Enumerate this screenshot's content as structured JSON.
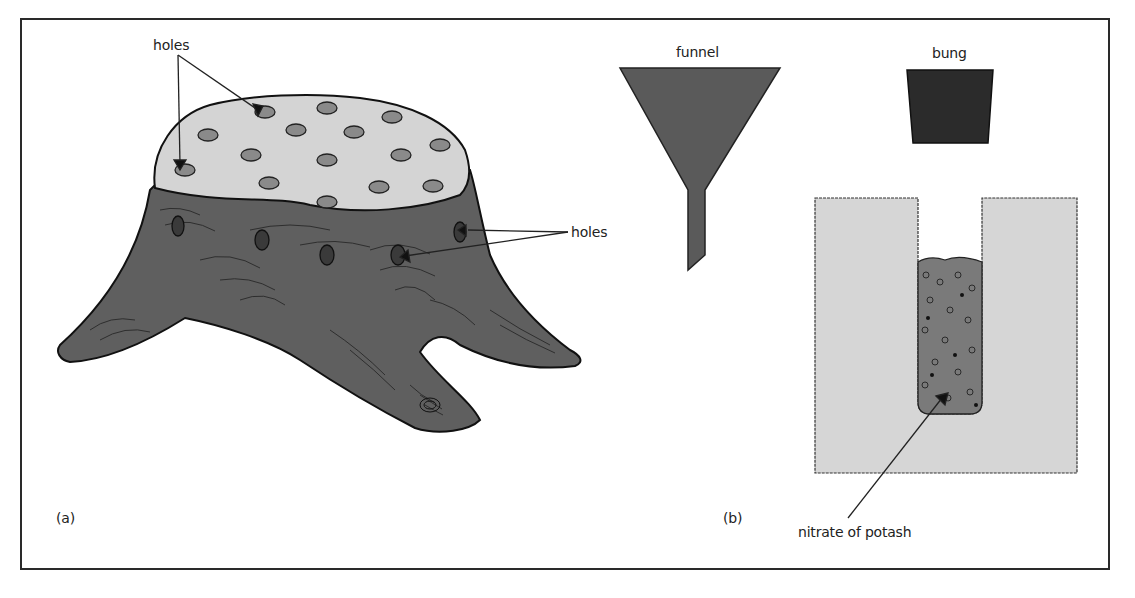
{
  "diagram": {
    "panels": [
      {
        "id": "a",
        "label": "(a)",
        "subject": "tree stump"
      },
      {
        "id": "b",
        "label": "(b)",
        "subject": "stump cross-section with funnel and bung"
      }
    ],
    "labels": {
      "holes_top": "holes",
      "holes_side": "holes",
      "funnel": "funnel",
      "bung": "bung",
      "nitrate": "nitrate of potash",
      "panel_a": "(a)",
      "panel_b": "(b)"
    },
    "colors": {
      "stump_bark": "#5f5f5f",
      "stump_top": "#d4d4d4",
      "funnel": "#5a5a5a",
      "bung": "#2b2b2b",
      "section": "#d6d6d6",
      "fill": "#7a7a7a",
      "frame": "#2a2a2a"
    },
    "top_hole_count": 16,
    "side_hole_count": 5
  }
}
